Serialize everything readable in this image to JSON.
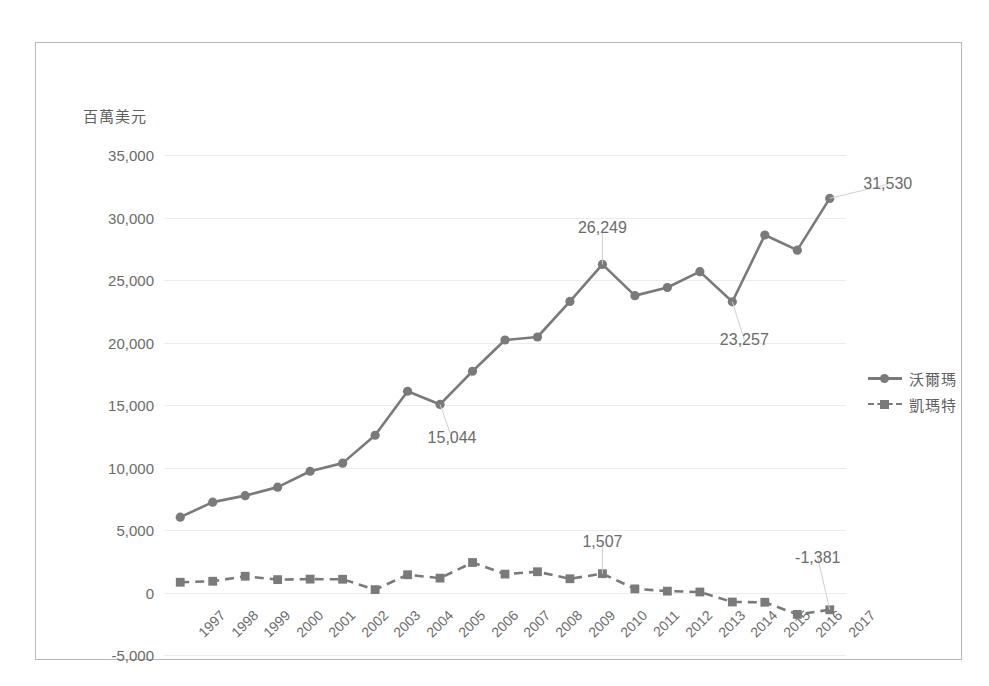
{
  "chart_data": {
    "type": "line",
    "title": "",
    "subtitle": "",
    "xlabel": "",
    "ylabel": "百萬美元",
    "ylim": [
      -5000,
      35000
    ],
    "ytick_values": [
      35000,
      30000,
      25000,
      20000,
      15000,
      10000,
      5000,
      0,
      -5000
    ],
    "ytick_labels": [
      "35,000",
      "30,000",
      "25,000",
      "20,000",
      "15,000",
      "10,000",
      "5,000",
      "0",
      "-5,000"
    ],
    "grid": true,
    "legend_position": "right",
    "categories": [
      "1997",
      "1998",
      "1999",
      "2000",
      "2001",
      "2002",
      "2003",
      "2004",
      "2005",
      "2006",
      "2007",
      "2008",
      "2009",
      "2010",
      "2011",
      "2012",
      "2013",
      "2014",
      "2015",
      "2016",
      "2017"
    ],
    "series": [
      {
        "name": "沃爾瑪",
        "marker": "circle",
        "linestyle": "solid",
        "color": "#7a7a7a",
        "values": [
          6030,
          7230,
          7750,
          8430,
          9700,
          10350,
          12580,
          16100,
          15044,
          17700,
          20200,
          20440,
          23290,
          26249,
          23750,
          24400,
          25670,
          23257,
          28600,
          27390,
          31530
        ]
      },
      {
        "name": "凱瑪特",
        "marker": "square",
        "linestyle": "dashed",
        "color": "#7a7a7a",
        "values": [
          820,
          900,
          1300,
          1030,
          1070,
          1060,
          230,
          1420,
          1150,
          2400,
          1470,
          1660,
          1100,
          1507,
          290,
          110,
          40,
          -760,
          -780,
          -1750,
          -1381
        ]
      }
    ],
    "annotations": [
      {
        "series": "沃爾瑪",
        "category": "2005",
        "text": "15,044",
        "dx": 12,
        "dy": 34
      },
      {
        "series": "沃爾瑪",
        "category": "2010",
        "text": "26,249",
        "dx": 0,
        "dy": -36
      },
      {
        "series": "沃爾瑪",
        "category": "2014",
        "text": "23,257",
        "dx": 12,
        "dy": 38
      },
      {
        "series": "沃爾瑪",
        "category": "2017",
        "text": "31,530",
        "dx": 58,
        "dy": -14
      },
      {
        "series": "凱瑪特",
        "category": "2010",
        "text": "1,507",
        "dx": 0,
        "dy": -32
      },
      {
        "series": "凱瑪特",
        "category": "2017",
        "text": "-1,381",
        "dx": -12,
        "dy": -52
      }
    ],
    "colors": {
      "line": "#7a7a7a",
      "grid": "#ededed",
      "text": "#6b6b6b",
      "border": "#b9b9b9",
      "background": "#ffffff"
    }
  }
}
